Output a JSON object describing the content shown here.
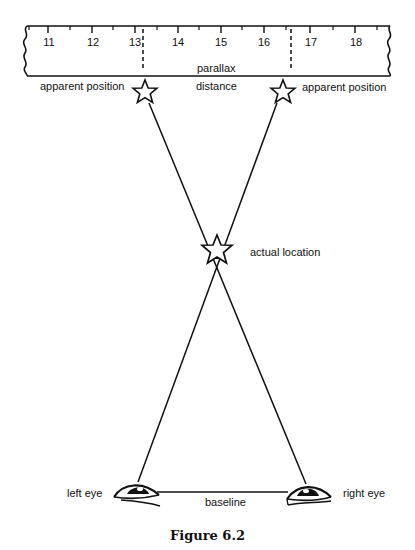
{
  "figure": {
    "caption": "Figure 6.2",
    "line_color": "#111111",
    "background": "#ffffff"
  },
  "ruler": {
    "tick_labels": [
      "11",
      "12",
      "13",
      "14",
      "15",
      "16",
      "17",
      "18"
    ],
    "parallax_label": "parallax"
  },
  "labels": {
    "apparent_position_left": "apparent position",
    "apparent_position_right": "apparent position",
    "distance": "distance",
    "actual_location": "actual location",
    "left_eye": "left eye",
    "right_eye": "right eye",
    "baseline": "baseline"
  },
  "icons": {
    "apparent_star_left": "star-outline-icon",
    "apparent_star_right": "star-outline-icon",
    "actual_star": "star-outline-icon",
    "left_eye": "eye-icon",
    "right_eye": "eye-icon"
  }
}
